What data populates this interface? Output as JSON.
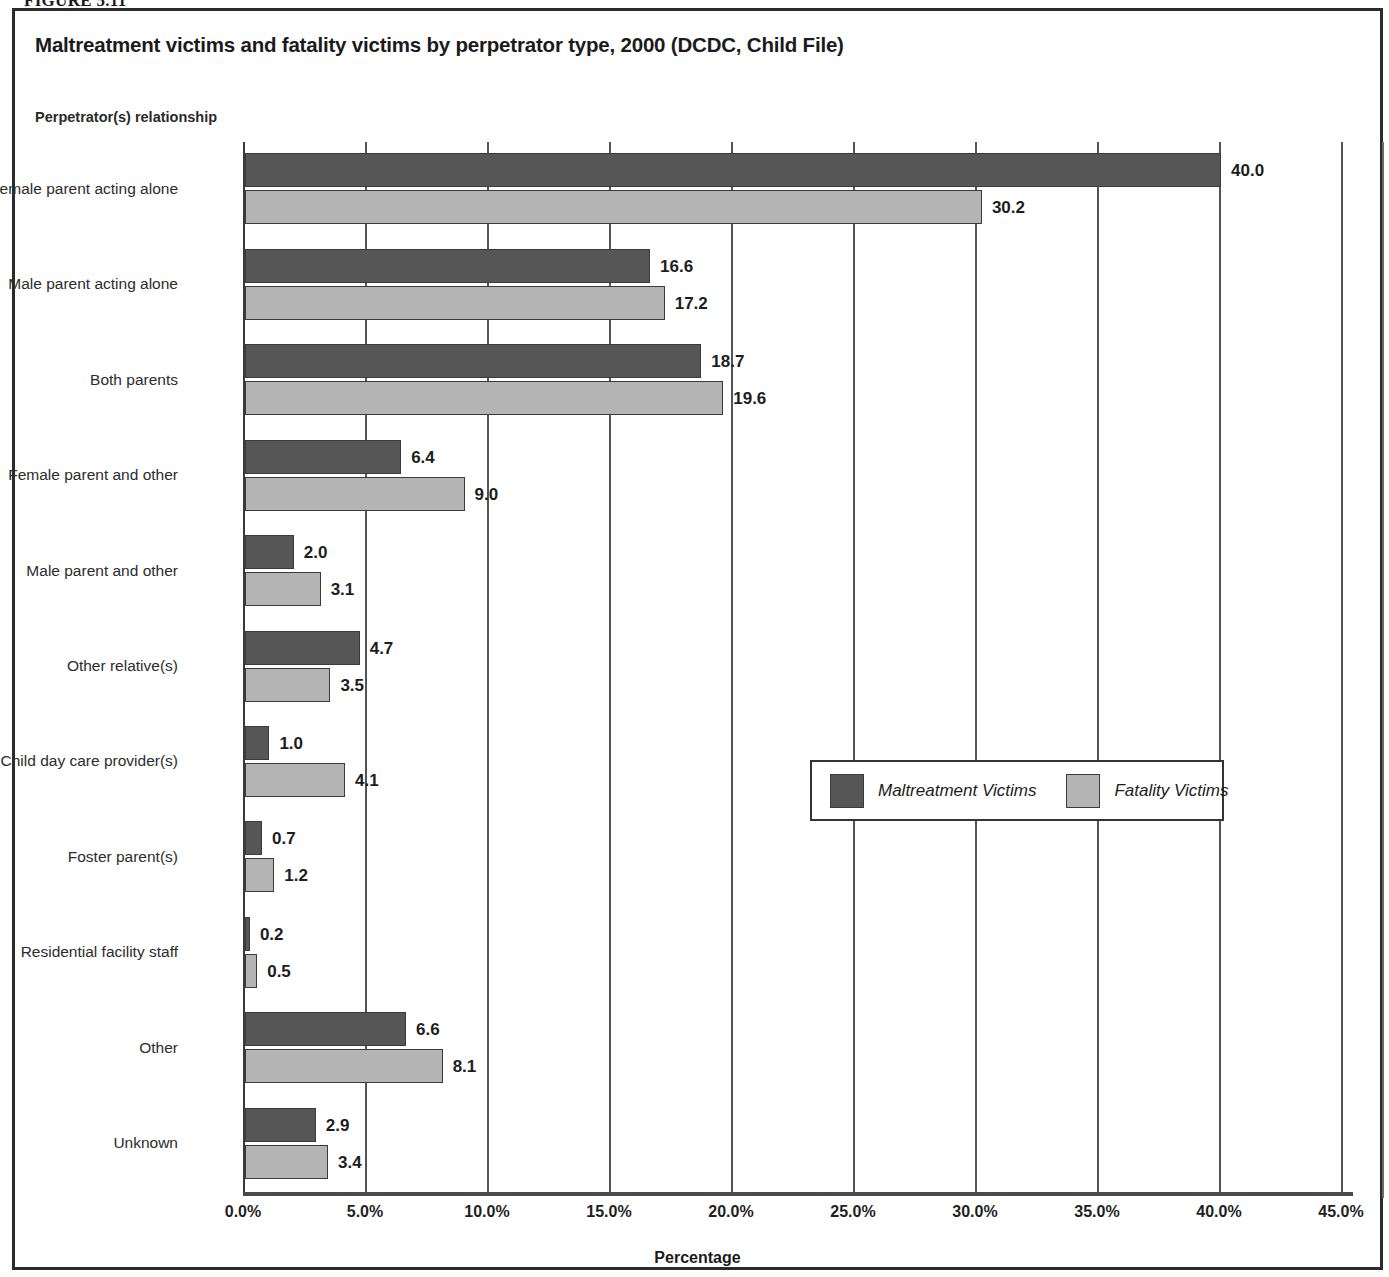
{
  "figure": {
    "caption": "FIGURE 5.11"
  },
  "chart_title": "Maltreatment victims and fatality victims by perpetrator type, 2000 (DCDC, Child File)",
  "y_axis_title": "Perpetrator(s) relationship",
  "x_axis_title": "Percentage",
  "legend": {
    "items": [
      {
        "label": "Maltreatment Victims",
        "color": "#565656"
      },
      {
        "label": "Fatality Victims",
        "color": "#b4b4b4"
      }
    ]
  },
  "chart_data": {
    "type": "bar",
    "orientation": "horizontal",
    "title": "Maltreatment victims and fatality victims by perpetrator type, 2000 (DCDC, Child File)",
    "xlabel": "Percentage",
    "ylabel": "Perpetrator(s) relationship",
    "xlim": [
      0,
      45
    ],
    "xticks": [
      "0.0%",
      "5.0%",
      "10.0%",
      "15.0%",
      "20.0%",
      "25.0%",
      "30.0%",
      "35.0%",
      "40.0%",
      "45.0%"
    ],
    "xtick_values": [
      0,
      5,
      10,
      15,
      20,
      25,
      30,
      35,
      40,
      45
    ],
    "grid": true,
    "legend_position": "center-right-inside",
    "categories": [
      "Female parent acting alone",
      "Male parent acting alone",
      "Both parents",
      "Female parent and other",
      "Male parent and other",
      "Other relative(s)",
      "Child day care provider(s)",
      "Foster parent(s)",
      "Residential facility staff",
      "Other",
      "Unknown"
    ],
    "series": [
      {
        "name": "Maltreatment Victims",
        "color": "#565656",
        "values": [
          40.0,
          16.6,
          18.7,
          6.4,
          2.0,
          4.7,
          1.0,
          0.7,
          0.2,
          6.6,
          2.9
        ],
        "labels": [
          "40.0",
          "16.6",
          "18.7",
          "6.4",
          "2.0",
          "4.7",
          "1.0",
          "0.7",
          "0.2",
          "6.6",
          "2.9"
        ]
      },
      {
        "name": "Fatality Victims",
        "color": "#b4b4b4",
        "values": [
          30.2,
          17.2,
          19.6,
          9.0,
          3.1,
          3.5,
          4.1,
          1.2,
          0.5,
          8.1,
          3.4
        ],
        "labels": [
          "30.2",
          "17.2",
          "19.6",
          "9.0",
          "3.1",
          "3.5",
          "4.1",
          "1.2",
          "0.5",
          "8.1",
          "3.4"
        ]
      }
    ]
  }
}
